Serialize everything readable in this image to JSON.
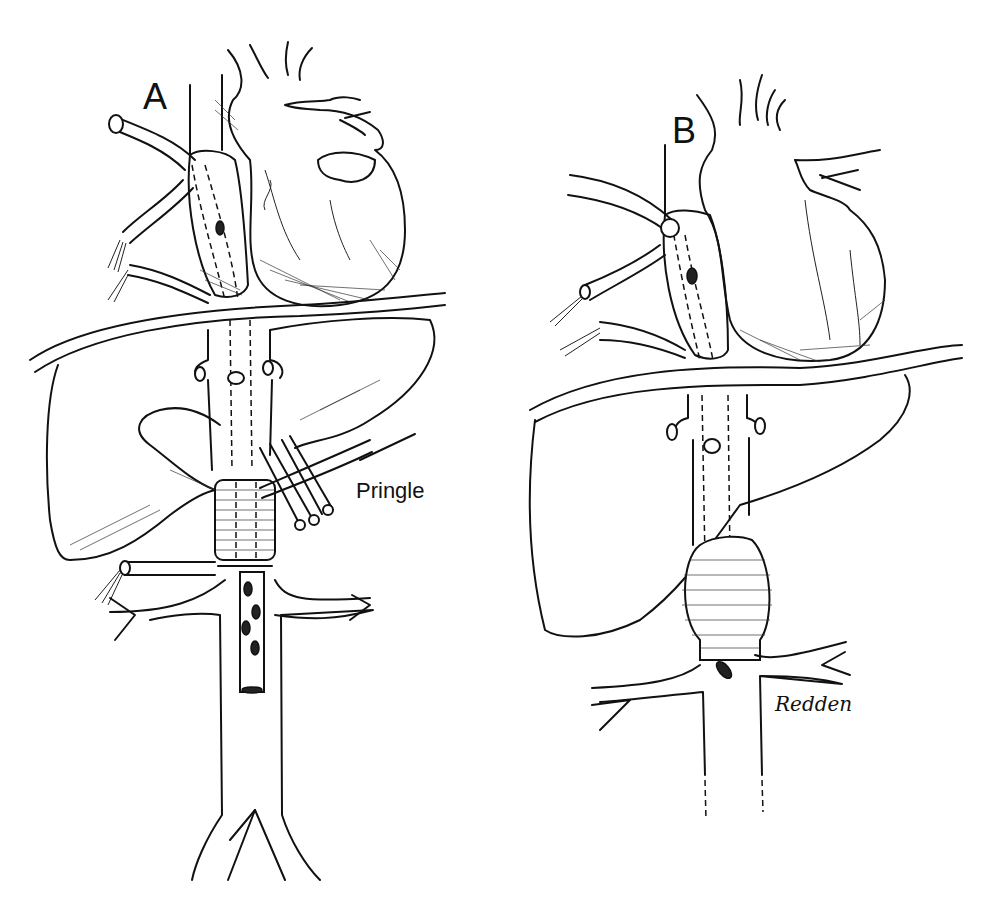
{
  "figure": {
    "panels": [
      {
        "id": "A",
        "label": "A",
        "annotations": [
          {
            "text": "Pringle"
          }
        ]
      },
      {
        "id": "B",
        "label": "B",
        "annotations": []
      }
    ],
    "signature": "Redden"
  }
}
